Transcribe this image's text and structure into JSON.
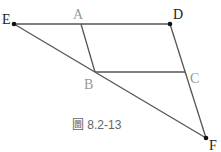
{
  "figure": {
    "caption": "圖 8.2-13",
    "caption_color": "#666666",
    "line_color": "#555555",
    "dark_label_color": "#222222",
    "light_label_color": "#999999",
    "points": [
      {
        "name": "E",
        "x": 14,
        "y": 24,
        "dot": true,
        "label_x": 2,
        "label_y": 24,
        "light": false
      },
      {
        "name": "A",
        "x": 81,
        "y": 24,
        "dot": false,
        "label_x": 73,
        "label_y": 19,
        "light": true
      },
      {
        "name": "D",
        "x": 170,
        "y": 24,
        "dot": true,
        "label_x": 173,
        "label_y": 19,
        "light": false
      },
      {
        "name": "B",
        "x": 95,
        "y": 72,
        "dot": false,
        "label_x": 84,
        "label_y": 89,
        "light": true
      },
      {
        "name": "C",
        "x": 185,
        "y": 72,
        "dot": false,
        "label_x": 190,
        "label_y": 83,
        "light": true
      },
      {
        "name": "F",
        "x": 206,
        "y": 138,
        "dot": true,
        "label_x": 209,
        "label_y": 150,
        "light": false
      }
    ],
    "segments": [
      [
        "E",
        "D"
      ],
      [
        "E",
        "F"
      ],
      [
        "D",
        "F"
      ],
      [
        "A",
        "B"
      ],
      [
        "B",
        "C"
      ]
    ]
  }
}
